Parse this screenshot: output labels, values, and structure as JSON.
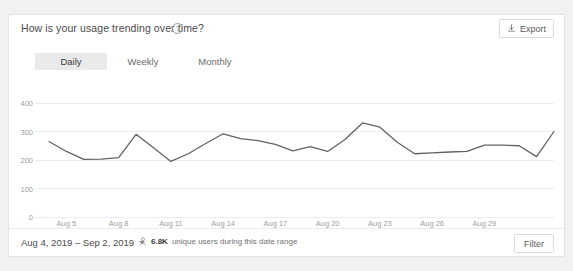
{
  "header": {
    "title": "How is your usage trending over time?",
    "help_icon": "help-circle-icon",
    "export_label": "Export",
    "export_icon": "export-icon"
  },
  "tabs": [
    {
      "label": "Daily",
      "active": true
    },
    {
      "label": "Weekly",
      "active": false
    },
    {
      "label": "Monthly",
      "active": false
    }
  ],
  "footer": {
    "date_range": "Aug 4, 2019 – Sep 2, 2019",
    "date_range_caret": "chevron-down-icon",
    "stat_icon": "person-icon",
    "stat_value": "6.8K",
    "stat_text": "unique users during this date range",
    "filter_label": "Filter"
  },
  "colors": {
    "line": "#5f6368",
    "grid": "#ededed",
    "tick_text": "#9e9e9e",
    "card_bg": "#ffffff",
    "page_bg": "#f1f1f1",
    "tab_active_bg": "#eaeaea"
  },
  "chart_data": {
    "type": "line",
    "title": "How is your usage trending over time?",
    "xlabel": "",
    "ylabel": "",
    "ylim": [
      0,
      400
    ],
    "yticks": [
      0,
      100,
      200,
      300,
      400
    ],
    "grid": true,
    "legend": false,
    "xticks": [
      "Aug 5",
      "Aug 8",
      "Aug 11",
      "Aug 14",
      "Aug 17",
      "Aug 20",
      "Aug 23",
      "Aug 26",
      "Aug 29"
    ],
    "xtick_indices": [
      1,
      4,
      7,
      10,
      13,
      16,
      19,
      22,
      25
    ],
    "x": [
      "Aug 4",
      "Aug 5",
      "Aug 6",
      "Aug 7",
      "Aug 8",
      "Aug 9",
      "Aug 10",
      "Aug 11",
      "Aug 12",
      "Aug 13",
      "Aug 14",
      "Aug 15",
      "Aug 16",
      "Aug 17",
      "Aug 18",
      "Aug 19",
      "Aug 20",
      "Aug 21",
      "Aug 22",
      "Aug 23",
      "Aug 24",
      "Aug 25",
      "Aug 26",
      "Aug 27",
      "Aug 28",
      "Aug 29",
      "Aug 30",
      "Aug 31",
      "Sep 1",
      "Sep 2"
    ],
    "series": [
      {
        "name": "Daily usage",
        "values": [
          265,
          230,
          202,
          203,
          208,
          290,
          243,
          195,
          222,
          258,
          292,
          275,
          268,
          255,
          232,
          247,
          230,
          272,
          330,
          315,
          262,
          222,
          225,
          228,
          230,
          252,
          252,
          250,
          212,
          300
        ]
      }
    ]
  }
}
